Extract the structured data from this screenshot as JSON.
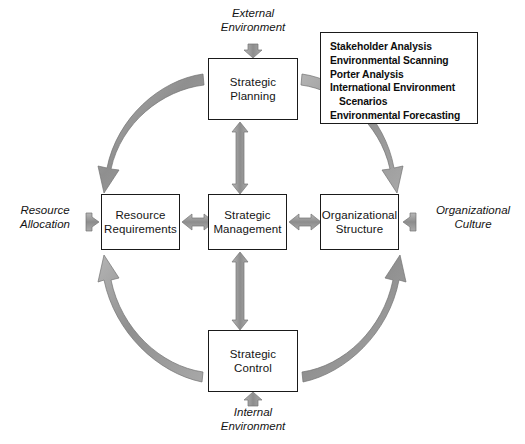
{
  "diagram": {
    "colors": {
      "arrow_fill": "#9a9a9a",
      "arrow_stroke": "#6e6e6e",
      "box_border": "#1a1a1a",
      "text": "#141414",
      "background": "#ffffff"
    },
    "nodes": [
      {
        "id": "strategic-planning",
        "label": "Strategic\nPlanning"
      },
      {
        "id": "resource-requirements",
        "label": "Resource\nRequirements"
      },
      {
        "id": "strategic-management",
        "label": "Strategic\nManagement"
      },
      {
        "id": "organizational-structure",
        "label": "Organizational\nStructure"
      },
      {
        "id": "strategic-control",
        "label": "Strategic\nControl"
      }
    ],
    "context_labels": [
      {
        "id": "external-environment",
        "label": "External\nEnvironment"
      },
      {
        "id": "internal-environment",
        "label": "Internal\nEnvironment"
      },
      {
        "id": "resource-allocation",
        "label": "Resource\nAllocation"
      },
      {
        "id": "organizational-culture",
        "label": "Organizational\nCulture"
      }
    ],
    "technique_list": {
      "items": [
        {
          "text": "Stakeholder Analysis",
          "indented": false
        },
        {
          "text": "Environmental Scanning",
          "indented": false
        },
        {
          "text": "Porter Analysis",
          "indented": false
        },
        {
          "text": "International Environment",
          "indented": false
        },
        {
          "text": "Scenarios",
          "indented": true
        },
        {
          "text": "Environmental Forecasting",
          "indented": false
        }
      ]
    },
    "connectors": [
      {
        "id": "planning-to-management",
        "kind": "vertical-double-arrow"
      },
      {
        "id": "management-to-control",
        "kind": "vertical-double-arrow"
      },
      {
        "id": "requirements-to-management",
        "kind": "horizontal-double-arrow"
      },
      {
        "id": "structure-to-management",
        "kind": "horizontal-double-arrow"
      },
      {
        "id": "external-environment-in",
        "kind": "small-down-arrow"
      },
      {
        "id": "internal-environment-in",
        "kind": "small-up-arrow"
      },
      {
        "id": "resource-allocation-in",
        "kind": "small-right-arrow"
      },
      {
        "id": "organizational-culture-in",
        "kind": "small-left-arrow"
      },
      {
        "id": "arc-planning-to-requirements",
        "kind": "arc-arrow",
        "direction": "counterclockwise"
      },
      {
        "id": "arc-control-to-requirements",
        "kind": "arc-arrow",
        "direction": "clockwise"
      },
      {
        "id": "arc-planning-to-structure",
        "kind": "arc-arrow",
        "direction": "clockwise"
      },
      {
        "id": "arc-control-to-structure",
        "kind": "arc-arrow",
        "direction": "counterclockwise"
      }
    ]
  }
}
